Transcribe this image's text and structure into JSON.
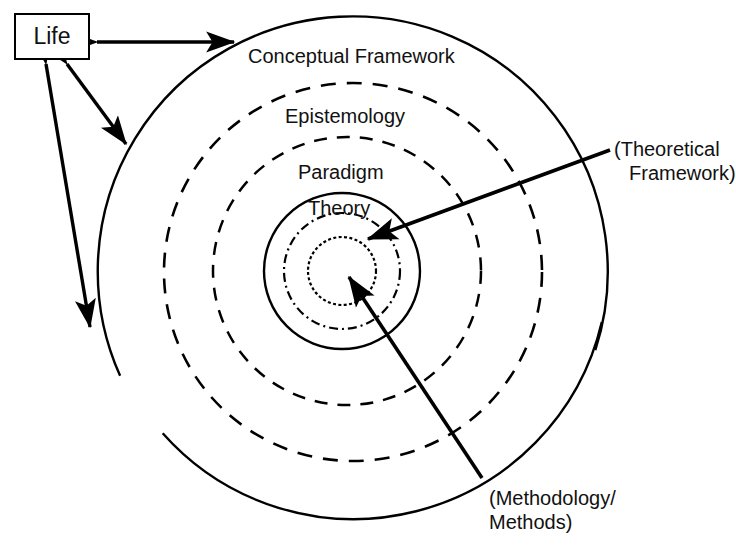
{
  "diagram": {
    "background": "#ffffff",
    "stroke_color": "#000000"
  },
  "life_box": {
    "label": "Life"
  },
  "rings": [
    {
      "name": "conceptual-framework",
      "label": "Conceptual Framework",
      "style": "solid",
      "cx": 353,
      "cy": 272,
      "r": 255
    },
    {
      "name": "epistemology",
      "label": "Epistemology",
      "style": "dashed",
      "cx": 353,
      "cy": 272,
      "r": 189
    },
    {
      "name": "paradigm",
      "label": "Paradigm",
      "style": "dashed",
      "cx": 347,
      "cy": 271,
      "r": 134
    },
    {
      "name": "theory",
      "label": "Theory",
      "style": "solid",
      "cx": 342,
      "cy": 271,
      "r": 78
    },
    {
      "name": "methodology-ring",
      "label": "",
      "style": "dashdot",
      "cx": 342,
      "cy": 271,
      "r": 58
    },
    {
      "name": "methods-core",
      "label": "",
      "style": "dotted",
      "cx": 342,
      "cy": 271,
      "r": 34
    }
  ],
  "ring_labels": {
    "conceptual_framework": "Conceptual Framework",
    "epistemology": "Epistemology",
    "paradigm": "Paradigm",
    "theory": "Theory"
  },
  "annotations": {
    "theoretical_framework": "(Theoretical\nFramework)",
    "theoretical_framework_line1": "(Theoretical",
    "theoretical_framework_line2": "Framework)",
    "methodology_methods": "(Methodology/\nMethods)",
    "methodology_methods_line1": "(Methodology/",
    "methodology_methods_line2": "Methods)"
  },
  "connectors": [
    {
      "name": "life-to-conceptual-framework",
      "type": "double-arrow",
      "from": [
        92,
        42
      ],
      "to": [
        239,
        42
      ]
    },
    {
      "name": "life-to-ring-upper",
      "type": "double-arrow",
      "from": [
        65,
        62
      ],
      "to": [
        128,
        146
      ]
    },
    {
      "name": "life-to-ring-lower",
      "type": "double-arrow",
      "from": [
        44,
        62
      ],
      "to": [
        90,
        331
      ]
    },
    {
      "name": "theoretical-framework-pointer",
      "type": "single-arrow",
      "from": [
        612,
        150
      ],
      "to": [
        364,
        240
      ]
    },
    {
      "name": "methodology-methods-pointer",
      "type": "single-arrow",
      "from": [
        482,
        478
      ],
      "to": [
        346,
        275
      ]
    }
  ]
}
